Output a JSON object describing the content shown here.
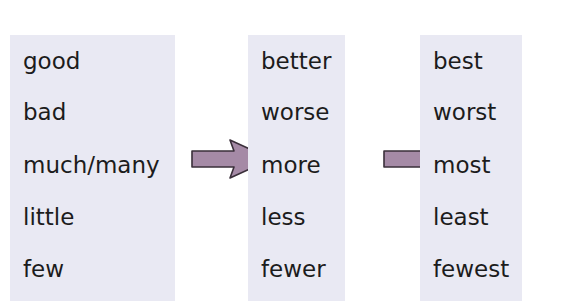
{
  "diagram": {
    "title_hint": "",
    "columns": [
      {
        "name": "base",
        "words": [
          "good",
          "bad",
          "much/many",
          "little",
          "few"
        ]
      },
      {
        "name": "comparative",
        "words": [
          "better",
          "worse",
          "more",
          "less",
          "fewer"
        ]
      },
      {
        "name": "superlative",
        "words": [
          "best",
          "worst",
          "most",
          "least",
          "fewest"
        ]
      }
    ],
    "arrows": [
      {
        "from": "base",
        "to": "comparative",
        "row": 2
      },
      {
        "from": "comparative",
        "to": "superlative",
        "row": 2
      }
    ],
    "colors": {
      "panel": "#e9e9f3",
      "arrow_fill": "#a58aa6",
      "arrow_stroke": "#3a2f3a",
      "text": "#1c1c1c"
    }
  }
}
